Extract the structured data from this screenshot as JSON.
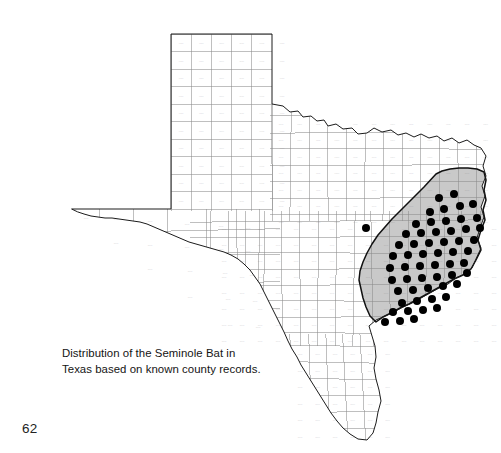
{
  "page": {
    "page_number": "62",
    "background_color": "#ffffff"
  },
  "figure": {
    "title_absent": true,
    "caption_lines": [
      "Distribution of the Seminole Bat in",
      "Texas based on known county records."
    ],
    "subject": "Seminole Bat",
    "region": "Texas",
    "map_type": "county-level distribution map"
  },
  "map": {
    "state_outline_color": "#1c1c1c",
    "county_line_color": "#8a8a8a",
    "shaded_region_fill": "#c9c9c9",
    "shaded_region_border_color": "#111111",
    "record_dot_color": "#000000",
    "record_dot_radius": 4.0,
    "shaded_region_label": "East Texas shaded range",
    "legend_present": false,
    "scale_bar_present": false,
    "north_arrow_present": false,
    "record_dot_count": 58,
    "outlier_dot_count": 1
  },
  "chart_data": {
    "type": "map",
    "title": "Distribution of the Seminole Bat in Texas based on known county records.",
    "xlabel": "",
    "ylabel": "",
    "state_outline": "M32,193 L131,193 L131,18 L232,18 L232,88 L243,90 L250,96 L258,95 L263,101 L271,100 L277,105 L284,104 L288,110 L296,108 L303,113 L312,112 L318,118 L327,117 L334,112 L342,116 L351,114 L358,119 L366,117 L374,121 L381,118 L389,122 L397,120 L404,125 L412,122 L419,127 L427,124 L434,129 L441,132 L446,140 L443,150 L446,160 L442,170 L445,180 L441,191 L444,201 L440,212 L437,222 L441,232 L436,243 L432,252 L425,258 L416,262 L408,268 L399,272 L390,277 L381,282 L372,287 L363,291 L354,296 L345,300 L336,304 L329,310 L332,320 L335,330 L336,341 L334,352 L336,363 L339,374 L341,385 L338,396 L336,407 L333,417 L327,424 L318,423 L310,418 L303,412 L297,405 L291,397 L286,389 L281,381 L276,373 L271,365 L266,357 L261,349 L257,341 L252,333 L248,325 L244,316 L240,308 L236,300 L232,292 L228,284 L224,276 L220,268 L215,261 L210,254 L204,248 L198,243 L191,239 L184,236 L177,234 L170,232 L163,230 L156,228 L149,226 L142,223 L135,220 L128,217 L121,214 L114,211 L107,208 L100,206 L93,205 L86,204 L79,203 L72,202 L65,202 L58,201 L51,200 L44,198 L38,196 Z",
    "shaded_region_path": "M396,158 L402,155 L410,153 L419,152 L428,152 L437,153 L444,156 L446,164 L444,174 L446,184 L443,194 L445,204 L441,214 L438,224 L441,234 L436,244 L431,253 L423,259 L414,263 L405,268 L396,273 L387,278 L378,283 L369,288 L360,292 L351,297 L343,301 L336,306 L330,300 L326,291 L323,282 L321,273 L319,264 L320,255 L323,246 L327,237 L332,228 L338,219 L345,211 L352,203 L360,195 L368,187 L376,179 L384,171 Z",
    "records": [
      {
        "x": 326,
        "y": 212,
        "in_shaded_region": false
      },
      {
        "x": 399,
        "y": 182,
        "in_shaded_region": true
      },
      {
        "x": 414,
        "y": 178,
        "in_shaded_region": true
      },
      {
        "x": 390,
        "y": 196,
        "in_shaded_region": true
      },
      {
        "x": 404,
        "y": 193,
        "in_shaded_region": true
      },
      {
        "x": 420,
        "y": 190,
        "in_shaded_region": true
      },
      {
        "x": 433,
        "y": 188,
        "in_shaded_region": true
      },
      {
        "x": 376,
        "y": 208,
        "in_shaded_region": true
      },
      {
        "x": 391,
        "y": 206,
        "in_shaded_region": true
      },
      {
        "x": 406,
        "y": 205,
        "in_shaded_region": true
      },
      {
        "x": 421,
        "y": 203,
        "in_shaded_region": true
      },
      {
        "x": 437,
        "y": 202,
        "in_shaded_region": true
      },
      {
        "x": 366,
        "y": 218,
        "in_shaded_region": true
      },
      {
        "x": 381,
        "y": 217,
        "in_shaded_region": true
      },
      {
        "x": 396,
        "y": 216,
        "in_shaded_region": true
      },
      {
        "x": 411,
        "y": 215,
        "in_shaded_region": true
      },
      {
        "x": 426,
        "y": 213,
        "in_shaded_region": true
      },
      {
        "x": 440,
        "y": 212,
        "in_shaded_region": true
      },
      {
        "x": 359,
        "y": 229,
        "in_shaded_region": true
      },
      {
        "x": 374,
        "y": 228,
        "in_shaded_region": true
      },
      {
        "x": 389,
        "y": 227,
        "in_shaded_region": true
      },
      {
        "x": 404,
        "y": 226,
        "in_shaded_region": true
      },
      {
        "x": 419,
        "y": 225,
        "in_shaded_region": true
      },
      {
        "x": 434,
        "y": 224,
        "in_shaded_region": true
      },
      {
        "x": 353,
        "y": 240,
        "in_shaded_region": true
      },
      {
        "x": 368,
        "y": 239,
        "in_shaded_region": true
      },
      {
        "x": 383,
        "y": 238,
        "in_shaded_region": true
      },
      {
        "x": 398,
        "y": 237,
        "in_shaded_region": true
      },
      {
        "x": 413,
        "y": 236,
        "in_shaded_region": true
      },
      {
        "x": 428,
        "y": 235,
        "in_shaded_region": true
      },
      {
        "x": 350,
        "y": 252,
        "in_shaded_region": true
      },
      {
        "x": 365,
        "y": 251,
        "in_shaded_region": true
      },
      {
        "x": 380,
        "y": 250,
        "in_shaded_region": true
      },
      {
        "x": 395,
        "y": 249,
        "in_shaded_region": true
      },
      {
        "x": 410,
        "y": 248,
        "in_shaded_region": true
      },
      {
        "x": 424,
        "y": 247,
        "in_shaded_region": true
      },
      {
        "x": 352,
        "y": 264,
        "in_shaded_region": true
      },
      {
        "x": 367,
        "y": 263,
        "in_shaded_region": true
      },
      {
        "x": 382,
        "y": 262,
        "in_shaded_region": true
      },
      {
        "x": 397,
        "y": 261,
        "in_shaded_region": true
      },
      {
        "x": 412,
        "y": 259,
        "in_shaded_region": true
      },
      {
        "x": 427,
        "y": 257,
        "in_shaded_region": true
      },
      {
        "x": 358,
        "y": 275,
        "in_shaded_region": true
      },
      {
        "x": 373,
        "y": 274,
        "in_shaded_region": true
      },
      {
        "x": 388,
        "y": 272,
        "in_shaded_region": true
      },
      {
        "x": 403,
        "y": 270,
        "in_shaded_region": true
      },
      {
        "x": 417,
        "y": 268,
        "in_shaded_region": true
      },
      {
        "x": 362,
        "y": 287,
        "in_shaded_region": true
      },
      {
        "x": 377,
        "y": 285,
        "in_shaded_region": true
      },
      {
        "x": 392,
        "y": 283,
        "in_shaded_region": true
      },
      {
        "x": 406,
        "y": 281,
        "in_shaded_region": true
      },
      {
        "x": 353,
        "y": 296,
        "in_shaded_region": true
      },
      {
        "x": 368,
        "y": 295,
        "in_shaded_region": true
      },
      {
        "x": 383,
        "y": 294,
        "in_shaded_region": true
      },
      {
        "x": 397,
        "y": 292,
        "in_shaded_region": true
      },
      {
        "x": 345,
        "y": 306,
        "in_shaded_region": true
      },
      {
        "x": 360,
        "y": 305,
        "in_shaded_region": true
      },
      {
        "x": 374,
        "y": 303,
        "in_shaded_region": true
      }
    ]
  }
}
